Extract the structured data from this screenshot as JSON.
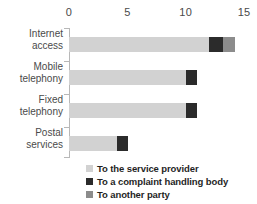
{
  "chart_data": {
    "type": "bar",
    "orientation": "horizontal",
    "stacked": true,
    "title": "",
    "subtitle": "",
    "xlabel": "",
    "ylabel": "",
    "xlim": [
      0,
      15
    ],
    "xticks": [
      0,
      5,
      10,
      15
    ],
    "xtick_labels": [
      "0",
      "5",
      "10",
      "15"
    ],
    "grid": false,
    "legend_position": "bottom",
    "categories": [
      "Internet access",
      "Mobile telephony",
      "Fixed telephony",
      "Postal services"
    ],
    "category_lines": [
      "Internet\naccess",
      "Mobile\ntelephony",
      "Fixed\ntelephony",
      "Postal\nservices"
    ],
    "series": [
      {
        "name": "To the service provider",
        "color": "#d2d2d2",
        "values": [
          12.0,
          10.0,
          10.0,
          4.1
        ]
      },
      {
        "name": "To a complaint handling body",
        "color": "#2b2b2b",
        "values": [
          1.2,
          0.95,
          1.0,
          1.0
        ]
      },
      {
        "name": "To another party",
        "color": "#8c8c8c",
        "values": [
          1.0,
          0,
          0,
          0
        ]
      }
    ],
    "totals": [
      14.2,
      10.95,
      11.0,
      5.1
    ]
  },
  "legend": {
    "items": [
      {
        "label": "To the service provider",
        "color": "#d2d2d2",
        "swatch_name": "legend-swatch-provider"
      },
      {
        "label": "To a complaint handling body",
        "color": "#2b2b2b",
        "swatch_name": "legend-swatch-complaint"
      },
      {
        "label": "To another party",
        "color": "#8c8c8c",
        "swatch_name": "legend-swatch-other"
      }
    ]
  },
  "colors": {
    "provider": "#d2d2d2",
    "complaint": "#2b2b2b",
    "other": "#8c8c8c",
    "axis": "#b8b8b8",
    "text": "#4a4a4a",
    "legend_text": "#1f1f1f",
    "background": "#ffffff"
  }
}
